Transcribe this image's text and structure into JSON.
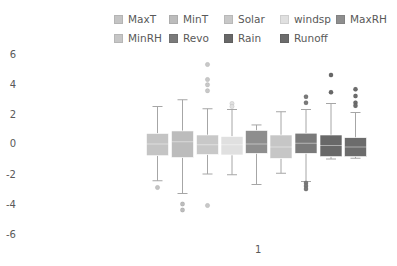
{
  "chart_data": {
    "type": "boxplot",
    "title": "",
    "xlabel": "",
    "ylabel": "",
    "categories": [
      "1"
    ],
    "ylim": [
      -6,
      6
    ],
    "yticks": [
      6,
      4,
      2,
      0,
      -2,
      -4,
      -6
    ],
    "ytick_labels": [
      "6",
      "4",
      "2",
      "0",
      "-2",
      "-4",
      "-6"
    ],
    "grid": false,
    "legend_position": "top",
    "series": [
      {
        "name": "MaxT",
        "color": "#c4c4c4",
        "whisker_high": 2.5,
        "q3": 0.7,
        "median": 0.0,
        "q1": -0.78,
        "whisker_low": -2.45,
        "outliers": [
          -2.9
        ]
      },
      {
        "name": "MinT",
        "color": "#bcbcbc",
        "whisker_high": 2.95,
        "q3": 0.87,
        "median": 0.15,
        "q1": -0.9,
        "whisker_low": -3.3,
        "outliers": [
          -4.0,
          -4.4
        ]
      },
      {
        "name": "Solar",
        "color": "#c8c8c8",
        "whisker_high": 2.35,
        "q3": 0.6,
        "median": -0.05,
        "q1": -0.7,
        "whisker_low": -2.0,
        "outliers": [
          5.3,
          4.3,
          3.95,
          3.55,
          -4.1
        ]
      },
      {
        "name": "windsp",
        "color": "#e0e0e0",
        "whisker_high": 2.3,
        "q3": 0.5,
        "median": -0.05,
        "q1": -0.73,
        "whisker_low": -2.05,
        "outliers": [
          2.7,
          2.5
        ]
      },
      {
        "name": "MaxRH",
        "color": "#8e8e8e",
        "whisker_high": 1.27,
        "q3": 0.9,
        "median": 0.0,
        "q1": -0.62,
        "whisker_low": -2.7,
        "outliers": []
      },
      {
        "name": "MinRH",
        "color": "#c6c6c6",
        "whisker_high": 2.15,
        "q3": 0.6,
        "median": -0.2,
        "q1": -0.96,
        "whisker_low": -1.95,
        "outliers": []
      },
      {
        "name": "Revo",
        "color": "#7a7a7a",
        "whisker_high": 2.3,
        "q3": 0.72,
        "median": 0.05,
        "q1": -0.62,
        "whisker_low": -2.5,
        "outliers": [
          3.15,
          2.75,
          -2.6,
          -2.8,
          -3.0
        ]
      },
      {
        "name": "Rain",
        "color": "#686868",
        "whisker_high": 2.7,
        "q3": 0.6,
        "median": -0.1,
        "q1": -0.84,
        "whisker_low": -1.0,
        "outliers": [
          4.6,
          3.45
        ]
      },
      {
        "name": "Runoff",
        "color": "#6c6c6c",
        "whisker_high": 2.1,
        "q3": 0.42,
        "median": -0.2,
        "q1": -0.84,
        "whisker_low": -0.95,
        "outliers": [
          3.65,
          3.2,
          2.75,
          2.55
        ]
      }
    ]
  },
  "legend": {
    "items": [
      {
        "label": "MaxT",
        "color": "#c4c4c4"
      },
      {
        "label": "MinT",
        "color": "#bcbcbc"
      },
      {
        "label": "Solar",
        "color": "#c8c8c8"
      },
      {
        "label": "windsp",
        "color": "#e0e0e0"
      },
      {
        "label": "MaxRH",
        "color": "#8e8e8e"
      },
      {
        "label": "MinRH",
        "color": "#c6c6c6"
      },
      {
        "label": "Revo",
        "color": "#7a7a7a"
      },
      {
        "label": "Rain",
        "color": "#686868"
      },
      {
        "label": "Runoff",
        "color": "#6c6c6c"
      }
    ]
  },
  "axes": {
    "y_labels": [
      "6",
      "4",
      "2",
      "0",
      "-2",
      "-4",
      "-6"
    ],
    "x_label": "1"
  }
}
